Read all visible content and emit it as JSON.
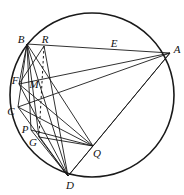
{
  "figure": {
    "type": "geometry-diagram",
    "stroke_color": "#1a1a1a",
    "background_color": "#ffffff",
    "circle": {
      "label": "circumscribed-circle",
      "cx": 92,
      "cy": 95,
      "r": 82,
      "stroke_width": 1.6
    },
    "points": [
      {
        "id": "A",
        "label": "A",
        "x": 170,
        "y": 53,
        "label_x": 177,
        "label_y": 49
      },
      {
        "id": "B",
        "label": "B",
        "x": 27,
        "y": 44,
        "label_x": 21,
        "label_y": 39
      },
      {
        "id": "C",
        "label": "C",
        "x": 18,
        "y": 107,
        "label_x": 11,
        "label_y": 111
      },
      {
        "id": "D",
        "label": "D",
        "x": 68,
        "y": 176,
        "label_x": 70,
        "label_y": 185
      },
      {
        "id": "E",
        "label": "E",
        "x": 113,
        "y": 48,
        "label_x": 114,
        "label_y": 43
      },
      {
        "id": "F",
        "label": "F",
        "x": 19,
        "y": 84,
        "label_x": 15,
        "label_y": 80
      },
      {
        "id": "G",
        "label": "G",
        "x": 39,
        "y": 137,
        "label_x": 33,
        "label_y": 142
      },
      {
        "id": "M",
        "label": "M",
        "x": 40,
        "y": 88,
        "label_x": 34,
        "label_y": 84
      },
      {
        "id": "P",
        "label": "P",
        "x": 31,
        "y": 130,
        "label_x": 25,
        "label_y": 129
      },
      {
        "id": "Q",
        "label": "Q",
        "x": 93,
        "y": 146,
        "label_x": 97,
        "label_y": 153
      },
      {
        "id": "R",
        "label": "R",
        "x": 44,
        "y": 46,
        "label_x": 45,
        "label_y": 39
      }
    ],
    "segments": [
      {
        "name": "segment-B-A",
        "from": "B",
        "to": "A",
        "style": "solid"
      },
      {
        "name": "segment-B-C",
        "from": "B",
        "to": "C",
        "style": "solid"
      },
      {
        "name": "segment-B-F",
        "from": "B",
        "to": "F",
        "style": "solid"
      },
      {
        "name": "segment-B-P",
        "from": "B",
        "to": "P",
        "style": "solid"
      },
      {
        "name": "segment-B-G",
        "from": "B",
        "to": "G",
        "style": "solid"
      },
      {
        "name": "segment-B-D",
        "from": "B",
        "to": "D",
        "style": "solid"
      },
      {
        "name": "segment-B-Q",
        "from": "B",
        "to": "Q",
        "style": "solid"
      },
      {
        "name": "segment-A-F",
        "from": "A",
        "to": "F",
        "style": "solid"
      },
      {
        "name": "segment-A-C",
        "from": "A",
        "to": "C",
        "style": "solid"
      },
      {
        "name": "segment-A-D",
        "from": "A",
        "to": "D",
        "style": "solid"
      },
      {
        "name": "segment-A-Q",
        "from": "A",
        "to": "Q",
        "style": "solid"
      },
      {
        "name": "segment-C-D",
        "from": "C",
        "to": "D",
        "style": "solid"
      },
      {
        "name": "segment-C-Q",
        "from": "C",
        "to": "Q",
        "style": "solid"
      },
      {
        "name": "segment-F-D",
        "from": "F",
        "to": "D",
        "style": "solid"
      },
      {
        "name": "segment-F-Q",
        "from": "F",
        "to": "Q",
        "style": "solid"
      },
      {
        "name": "segment-P-Q",
        "from": "P",
        "to": "Q",
        "style": "solid"
      },
      {
        "name": "segment-P-D",
        "from": "P",
        "to": "D",
        "style": "solid"
      },
      {
        "name": "segment-G-D",
        "from": "G",
        "to": "D",
        "style": "solid"
      },
      {
        "name": "segment-G-Q",
        "from": "G",
        "to": "Q",
        "style": "solid"
      },
      {
        "name": "segment-R-D",
        "from": "R",
        "to": "D",
        "style": "solid"
      },
      {
        "name": "segment-R-F",
        "from": "R",
        "to": "F",
        "style": "solid"
      },
      {
        "name": "segment-D-Q",
        "from": "D",
        "to": "Q",
        "style": "solid"
      },
      {
        "name": "segment-R-G-dashed",
        "from": "R",
        "to": "G",
        "style": "dashed"
      }
    ]
  }
}
